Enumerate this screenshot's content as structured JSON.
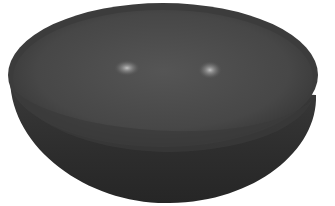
{
  "image": {
    "subject": "dark stone bowl",
    "background_color": "#ffffff",
    "bowl_outer_color": "#2e2e2e",
    "bowl_inner_color": "#4a4a4a",
    "rim_color": "#3a3a3a",
    "highlight_color": "#bdbdbd"
  }
}
